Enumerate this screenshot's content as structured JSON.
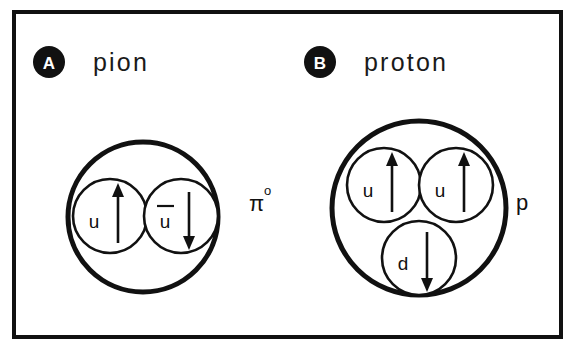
{
  "figure": {
    "frame": {
      "stroke_color": "#111111",
      "background": "#ffffff"
    },
    "panels": [
      {
        "badge": "A",
        "title": "pion",
        "particle_symbol": "π",
        "particle_superscript": "o",
        "containment": {
          "cx": 143,
          "cy": 217,
          "r": 75
        },
        "quarks": [
          {
            "label": "u",
            "overbar": false,
            "spin": "up",
            "cx": 110,
            "cy": 216,
            "r": 37
          },
          {
            "label": "u",
            "overbar": true,
            "spin": "down",
            "cx": 181,
            "cy": 216,
            "r": 37
          }
        ]
      },
      {
        "badge": "B",
        "title": "proton",
        "particle_symbol": "p",
        "particle_superscript": "",
        "containment": {
          "cx": 419,
          "cy": 208,
          "r": 87
        },
        "quarks": [
          {
            "label": "u",
            "overbar": false,
            "spin": "up",
            "cx": 384,
            "cy": 185,
            "r": 37
          },
          {
            "label": "u",
            "overbar": false,
            "spin": "up",
            "cx": 456,
            "cy": 185,
            "r": 37
          },
          {
            "label": "d",
            "overbar": false,
            "spin": "down",
            "cx": 419,
            "cy": 258,
            "r": 37
          }
        ]
      }
    ]
  }
}
